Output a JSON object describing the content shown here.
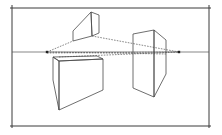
{
  "diagram": {
    "type": "two-point-perspective",
    "colors": {
      "background": "#ffffff",
      "line": "#4a4a4a",
      "vanishing_point": "#222222"
    },
    "frame": {
      "x1": 12,
      "y1": 8,
      "x2": 209,
      "y2": 126
    },
    "horizon": {
      "y": 52,
      "x1": 12,
      "x2": 209
    },
    "vanishing_points": [
      {
        "name": "left",
        "x": 47,
        "y": 52
      },
      {
        "name": "right",
        "x": 179,
        "y": 52
      }
    ],
    "boxes": [
      {
        "name": "top-box-above-horizon",
        "faces": [
          "73,31 91,12 92,36 73,41",
          "91,12 99,15 99,33 92,36"
        ]
      },
      {
        "name": "left-box-below-horizon",
        "faces": [
          "53,57 59,61 59,110 53,80",
          "59,61 103,59 103,90 59,110",
          "53,57 97,56 103,59 59,61"
        ]
      },
      {
        "name": "right-box-straddling-horizon",
        "faces": [
          "133,34 154,30 154,97 133,88",
          "154,30 166,40 166,74 154,97"
        ]
      }
    ],
    "construction_lines": [
      {
        "x1": 47,
        "y1": 52,
        "x2": 73,
        "y2": 41
      },
      {
        "x1": 92,
        "y1": 36,
        "x2": 179,
        "y2": 52
      },
      {
        "x1": 47,
        "y1": 52,
        "x2": 166,
        "y2": 54
      },
      {
        "x1": 47,
        "y1": 53,
        "x2": 179,
        "y2": 52
      },
      {
        "x1": 59,
        "y1": 57,
        "x2": 179,
        "y2": 52
      }
    ]
  }
}
